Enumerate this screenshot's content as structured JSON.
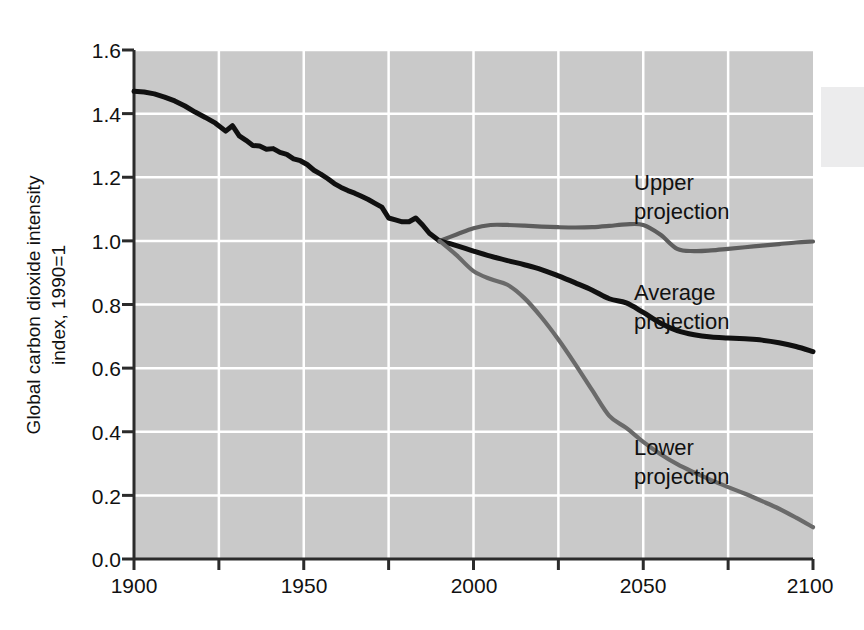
{
  "chart_data": {
    "type": "line",
    "title": "",
    "xlabel": "",
    "ylabel": "Global carbon dioxide intensity index, 1990=1",
    "ylabel_line1": "Global carbon dioxide intensity",
    "ylabel_line2": "index, 1990=1",
    "xlim": [
      1900,
      2100
    ],
    "ylim": [
      0.0,
      1.6
    ],
    "grid": true,
    "legend_position": "inline-right",
    "x_ticks": [
      1900,
      1950,
      2000,
      2050,
      2100
    ],
    "x_tick_labels": [
      "1900",
      "1950",
      "2000",
      "2050",
      "2100"
    ],
    "x_minor_ticks": [
      1925,
      1975,
      2025,
      2075
    ],
    "y_ticks": [
      0.0,
      0.2,
      0.4,
      0.6,
      0.8,
      1.0,
      1.2,
      1.4,
      1.6
    ],
    "y_tick_labels": [
      "0.0",
      "0.2",
      "0.4",
      "0.6",
      "0.8",
      "1.0",
      "1.2",
      "1.4",
      "1.6"
    ],
    "colors": {
      "plot_background": "#c9c9c9",
      "gridline": "#ffffff",
      "axis": "#2b2b2b",
      "historical": "#101010",
      "average_projection": "#101010",
      "upper_projection": "#5d5d5d",
      "lower_projection": "#6a6a6a",
      "page_background": "#ffffff"
    },
    "series": [
      {
        "name": "Historical",
        "color": "#101010",
        "x": [
          1900,
          1903,
          1906,
          1909,
          1912,
          1915,
          1918,
          1921,
          1924,
          1927,
          1929,
          1931,
          1933,
          1935,
          1937,
          1939,
          1941,
          1943,
          1945,
          1947,
          1949,
          1951,
          1953,
          1955,
          1957,
          1959,
          1961,
          1963,
          1965,
          1967,
          1969,
          1971,
          1973,
          1975,
          1977,
          1979,
          1981,
          1983,
          1985,
          1987,
          1990
        ],
        "values": [
          1.47,
          1.468,
          1.462,
          1.452,
          1.44,
          1.424,
          1.405,
          1.388,
          1.37,
          1.345,
          1.362,
          1.33,
          1.316,
          1.3,
          1.298,
          1.288,
          1.29,
          1.278,
          1.272,
          1.258,
          1.252,
          1.24,
          1.222,
          1.21,
          1.196,
          1.18,
          1.168,
          1.158,
          1.15,
          1.14,
          1.13,
          1.118,
          1.106,
          1.072,
          1.066,
          1.06,
          1.06,
          1.072,
          1.05,
          1.024,
          1.0
        ]
      },
      {
        "name": "Upper projection",
        "color": "#5d5d5d",
        "x": [
          1990,
          1995,
          2000,
          2005,
          2010,
          2015,
          2020,
          2025,
          2030,
          2035,
          2040,
          2045,
          2050,
          2055,
          2060,
          2065,
          2070,
          2075,
          2080,
          2085,
          2090,
          2095,
          2100
        ],
        "values": [
          1.0,
          1.02,
          1.04,
          1.05,
          1.05,
          1.048,
          1.045,
          1.043,
          1.042,
          1.043,
          1.047,
          1.052,
          1.05,
          1.02,
          0.975,
          0.968,
          0.97,
          0.975,
          0.98,
          0.985,
          0.99,
          0.995,
          0.998
        ]
      },
      {
        "name": "Average projection",
        "color": "#101010",
        "x": [
          1990,
          1995,
          2000,
          2005,
          2010,
          2015,
          2020,
          2025,
          2030,
          2035,
          2040,
          2045,
          2050,
          2055,
          2060,
          2065,
          2070,
          2075,
          2080,
          2085,
          2090,
          2095,
          2100
        ],
        "values": [
          1.0,
          0.985,
          0.968,
          0.952,
          0.938,
          0.925,
          0.91,
          0.89,
          0.868,
          0.845,
          0.818,
          0.805,
          0.775,
          0.742,
          0.718,
          0.705,
          0.698,
          0.695,
          0.692,
          0.688,
          0.68,
          0.668,
          0.652
        ]
      },
      {
        "name": "Lower projection",
        "color": "#6a6a6a",
        "x": [
          1990,
          1995,
          2000,
          2005,
          2010,
          2015,
          2020,
          2025,
          2030,
          2035,
          2040,
          2045,
          2050,
          2055,
          2060,
          2065,
          2070,
          2075,
          2080,
          2085,
          2090,
          2095,
          2100
        ],
        "values": [
          1.0,
          0.955,
          0.905,
          0.88,
          0.862,
          0.82,
          0.76,
          0.69,
          0.612,
          0.53,
          0.45,
          0.412,
          0.368,
          0.33,
          0.298,
          0.272,
          0.248,
          0.226,
          0.205,
          0.182,
          0.158,
          0.13,
          0.1
        ]
      }
    ],
    "annotations": [
      {
        "id": "upper",
        "text_line1": "Upper",
        "text_line2": "projection",
        "x": 2045,
        "y": 1.28
      },
      {
        "id": "average",
        "text_line1": "Average",
        "text_line2": "projection",
        "x": 2045,
        "y": 0.9
      },
      {
        "id": "lower",
        "text_line1": "Lower",
        "text_line2": "projection",
        "x": 2045,
        "y": 0.4
      }
    ]
  },
  "labels": {
    "y_axis_title_line1": "Global carbon dioxide intensity",
    "y_axis_title_line2": "index, 1990=1",
    "upper_line1": "Upper",
    "upper_line2": "projection",
    "average_line1": "Average",
    "average_line2": "projection",
    "lower_line1": "Lower",
    "lower_line2": "projection",
    "y0": "0.0",
    "y1": "0.2",
    "y2": "0.4",
    "y3": "0.6",
    "y4": "0.8",
    "y5": "1.0",
    "y6": "1.2",
    "y7": "1.4",
    "y8": "1.6",
    "x0": "1900",
    "x1": "1950",
    "x2": "2000",
    "x3": "2050",
    "x4": "2100"
  }
}
